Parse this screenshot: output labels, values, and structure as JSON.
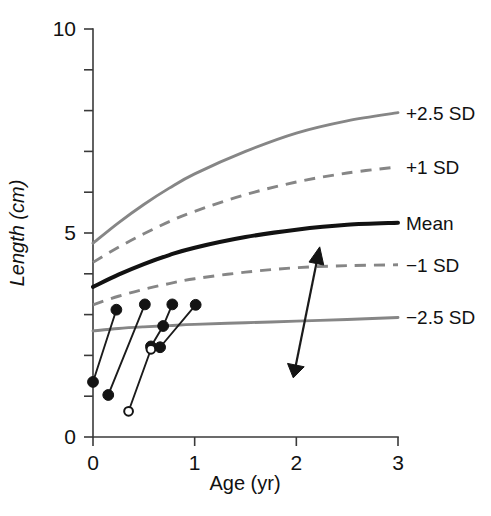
{
  "chart_data": {
    "type": "line",
    "title": "",
    "subtitle": "",
    "xlabel": "Age (yr)",
    "ylabel": "Length (cm)",
    "xlim": [
      0,
      3
    ],
    "ylim": [
      0,
      10
    ],
    "xticks": [
      "0",
      "1",
      "2",
      "3"
    ],
    "xtick_values": [
      0,
      1,
      2,
      3
    ],
    "yticks_labeled": [
      "0",
      "5",
      "10"
    ],
    "ytick_values": [
      0,
      1,
      2,
      3,
      4,
      5,
      6,
      7,
      8,
      9,
      10
    ],
    "ytick_labeled_values": [
      0,
      5,
      10
    ],
    "grid": false,
    "legend_position": "right-inline",
    "reference_curves": [
      {
        "name": "+2.5 SD",
        "label": "+2.5 SD",
        "style": "solid",
        "color": "#868686",
        "x": [
          0,
          0.25,
          0.5,
          0.75,
          1.0,
          1.5,
          2.0,
          2.5,
          3.0
        ],
        "y": [
          4.75,
          5.25,
          5.7,
          6.1,
          6.45,
          7.0,
          7.45,
          7.75,
          7.95
        ]
      },
      {
        "name": "+1 SD",
        "label": "+1 SD",
        "style": "dashed",
        "color": "#868686",
        "x": [
          0,
          0.25,
          0.5,
          0.75,
          1.0,
          1.5,
          2.0,
          2.5,
          3.0
        ],
        "y": [
          4.28,
          4.65,
          4.98,
          5.28,
          5.53,
          5.94,
          6.25,
          6.47,
          6.62
        ]
      },
      {
        "name": "Mean",
        "label": "Mean",
        "style": "solid-bold",
        "color": "#121212",
        "x": [
          0,
          0.25,
          0.5,
          0.75,
          1.0,
          1.5,
          2.0,
          2.5,
          3.0
        ],
        "y": [
          3.68,
          3.98,
          4.24,
          4.46,
          4.64,
          4.9,
          5.08,
          5.2,
          5.25
        ]
      },
      {
        "name": "-1 SD",
        "label": "−1 SD",
        "style": "dashed",
        "color": "#868686",
        "x": [
          0,
          0.25,
          0.5,
          0.75,
          1.0,
          1.5,
          2.0,
          2.5,
          3.0
        ],
        "y": [
          3.24,
          3.45,
          3.62,
          3.76,
          3.88,
          4.04,
          4.15,
          4.2,
          4.22
        ]
      },
      {
        "name": "-2.5 SD",
        "label": "−2.5 SD",
        "style": "solid",
        "color": "#868686",
        "x": [
          0,
          0.25,
          0.5,
          0.75,
          1.0,
          1.5,
          2.0,
          2.5,
          3.0
        ],
        "y": [
          2.6,
          2.66,
          2.7,
          2.73,
          2.76,
          2.8,
          2.84,
          2.88,
          2.93
        ]
      }
    ],
    "patient_segments": [
      {
        "name": "patient-1",
        "marker": "filled",
        "points": [
          {
            "x": 0.0,
            "y": 1.35
          },
          {
            "x": 0.23,
            "y": 3.12
          }
        ]
      },
      {
        "name": "patient-2",
        "marker": "filled",
        "points": [
          {
            "x": 0.15,
            "y": 1.03
          },
          {
            "x": 0.51,
            "y": 3.25
          }
        ]
      },
      {
        "name": "patient-3",
        "marker": "filled",
        "points": [
          {
            "x": 0.57,
            "y": 2.22
          },
          {
            "x": 0.69,
            "y": 2.72
          },
          {
            "x": 0.78,
            "y": 3.25
          }
        ]
      },
      {
        "name": "patient-4",
        "marker": "open",
        "points": [
          {
            "x": 0.35,
            "y": 0.63
          },
          {
            "x": 0.57,
            "y": 2.15
          }
        ]
      },
      {
        "name": "patient-5",
        "marker": "filled",
        "points": [
          {
            "x": 0.66,
            "y": 2.2
          },
          {
            "x": 1.01,
            "y": 3.24
          }
        ]
      }
    ],
    "annotation_arrow": {
      "name": "growth-response-arrow",
      "from": {
        "x": 1.97,
        "y": 1.45
      },
      "to": {
        "x": 2.23,
        "y": 4.66
      },
      "color": "#141414",
      "head": "triangle",
      "tail": "triangle"
    }
  }
}
